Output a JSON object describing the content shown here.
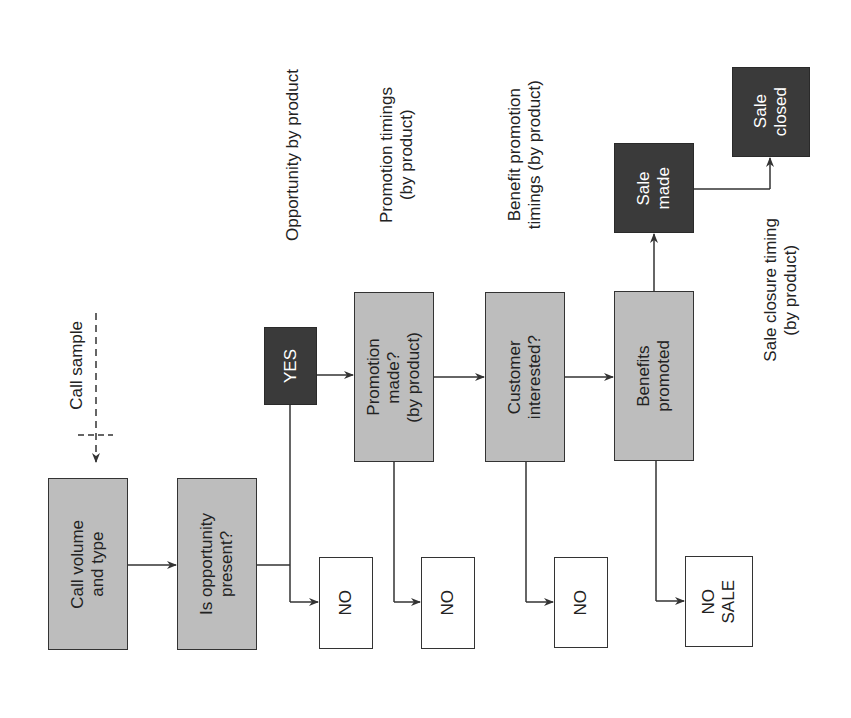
{
  "diagram": {
    "orientation": "rotated -90deg (text reads bottom-to-top)",
    "nodes": {
      "call_volume": {
        "label": "Call volume\nand type",
        "style": "grey"
      },
      "opportunity": {
        "label": "Is opportunity\npresent?",
        "style": "grey"
      },
      "yes": {
        "label": "YES",
        "style": "dark"
      },
      "promotion": {
        "label": "Promotion\nmade?\n(by product)",
        "style": "grey"
      },
      "customer": {
        "label": "Customer\ninterested?",
        "style": "grey"
      },
      "benefits": {
        "label": "Benefits\npromoted",
        "style": "grey"
      },
      "sale_made": {
        "label": "Sale\nmade",
        "style": "dark"
      },
      "sale_closed": {
        "label": "Sale\nclosed",
        "style": "dark"
      },
      "no1": {
        "label": "NO",
        "style": "white"
      },
      "no2": {
        "label": "NO",
        "style": "white"
      },
      "no3": {
        "label": "NO",
        "style": "white"
      },
      "no_sale": {
        "label": "NO\nSALE",
        "style": "white"
      }
    },
    "annotations": {
      "call_sample": "Call sample",
      "opportunity_by_product": "Opportunity by product",
      "promotion_timings": "Promotion timings\n(by product)",
      "benefit_promotion_timings": "Benefit promotion\ntimings (by product)",
      "sale_closure_timing": "Sale closure timing\n(by product)"
    },
    "edges": [
      {
        "from": "call_sample",
        "to": "call_volume",
        "style": "dashed"
      },
      {
        "from": "call_volume",
        "to": "opportunity"
      },
      {
        "from": "opportunity",
        "to": "yes"
      },
      {
        "from": "opportunity",
        "to": "no1"
      },
      {
        "from": "yes",
        "to": "promotion"
      },
      {
        "from": "promotion",
        "to": "customer"
      },
      {
        "from": "promotion",
        "to": "no2"
      },
      {
        "from": "customer",
        "to": "benefits"
      },
      {
        "from": "customer",
        "to": "no3"
      },
      {
        "from": "benefits",
        "to": "sale_made"
      },
      {
        "from": "benefits",
        "to": "no_sale"
      },
      {
        "from": "sale_made",
        "to": "sale_closed"
      }
    ],
    "colors": {
      "grey_fill": "#bdbdbd",
      "dark_fill": "#3a3a3a",
      "line": "#333333"
    }
  }
}
